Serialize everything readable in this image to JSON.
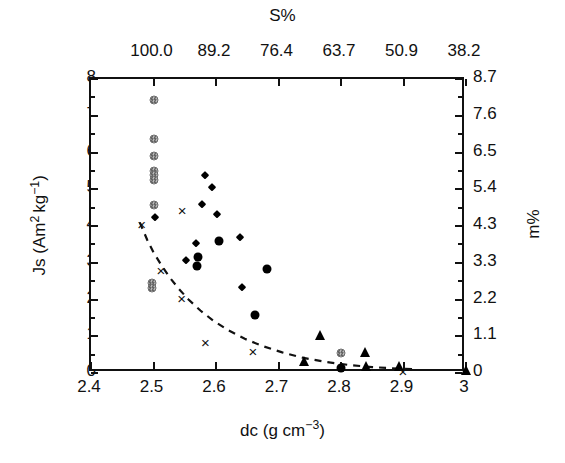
{
  "figure": {
    "panel_label": "b",
    "background": "#ffffff",
    "marker_color": "#000000",
    "stipple_color": "#6a6a6a"
  },
  "axes": {
    "bottom": {
      "title_main": "dc (g cm",
      "title_sup": "−3",
      "title_close": ")",
      "label": "dc (g cm−3)",
      "ticks": [
        "2.4",
        "2.5",
        "2.6",
        "2.7",
        "2.8",
        "2.9",
        "3"
      ],
      "range": [
        2.4,
        3.0
      ]
    },
    "top": {
      "title": "S%",
      "ticks": [
        "100.0",
        "89.2",
        "76.4",
        "63.7",
        "50.9",
        "38.2"
      ],
      "tick_positions_dc": [
        2.5,
        2.6,
        2.7,
        2.8,
        2.9,
        3.0
      ]
    },
    "left": {
      "title_main": "Js (Am",
      "title_sup1": "2",
      "title_mid": "kg",
      "title_sup2": "−1",
      "title_close": ")",
      "label": "Js (Am2 kg−1)",
      "ticks": [
        "0",
        "1",
        "2",
        "3",
        "4",
        "5",
        "6",
        "7",
        "8"
      ],
      "range": [
        0,
        8
      ]
    },
    "right": {
      "title": "m%",
      "ticks": [
        "0",
        "1.1",
        "2.2",
        "3.3",
        "4.3",
        "5.4",
        "6.5",
        "7.6",
        "8.7"
      ],
      "range": [
        0,
        8.7
      ]
    }
  },
  "chart_data": {
    "type": "scatter",
    "title": "",
    "xlabel": "dc (g cm−3)",
    "ylabel": "Js (Am2 kg−1)",
    "xlim": [
      2.4,
      3.0
    ],
    "ylim": [
      0,
      8
    ],
    "grid": false,
    "legend": "none",
    "secondary_xaxis": {
      "label": "S%",
      "ticks": [
        100.0,
        89.2,
        76.4,
        63.7,
        50.9,
        38.2
      ]
    },
    "secondary_yaxis": {
      "label": "m%",
      "ticks": [
        0,
        1.1,
        2.2,
        3.3,
        4.3,
        5.4,
        6.5,
        7.6,
        8.7
      ]
    },
    "series": [
      {
        "name": "stippled-circle",
        "marker": "circle-stipple",
        "size": 9,
        "points": [
          [
            2.5,
            7.42
          ],
          [
            2.5,
            6.38
          ],
          [
            2.5,
            5.9
          ],
          [
            2.5,
            5.5
          ],
          [
            2.5,
            5.38
          ],
          [
            2.5,
            5.26
          ],
          [
            2.5,
            4.58
          ],
          [
            2.497,
            2.46
          ],
          [
            2.497,
            2.31
          ],
          [
            2.8,
            0.55
          ]
        ]
      },
      {
        "name": "filled-circle",
        "marker": "circle-filled",
        "size": 9,
        "points": [
          [
            2.571,
            3.17
          ],
          [
            2.569,
            2.9
          ],
          [
            2.605,
            3.59
          ],
          [
            2.681,
            2.84
          ],
          [
            2.663,
            1.57
          ],
          [
            2.8,
            0.14
          ]
        ]
      },
      {
        "name": "filled-diamond",
        "marker": "diamond",
        "size": 8,
        "points": [
          [
            2.502,
            4.24
          ],
          [
            2.583,
            5.38
          ],
          [
            2.594,
            5.05
          ],
          [
            2.578,
            4.6
          ],
          [
            2.601,
            4.32
          ],
          [
            2.568,
            3.53
          ],
          [
            2.639,
            3.69
          ],
          [
            2.552,
            3.07
          ],
          [
            2.641,
            2.34
          ]
        ]
      },
      {
        "name": "filled-triangle",
        "marker": "triangle",
        "size": 10,
        "points": [
          [
            2.766,
            0.94
          ],
          [
            2.838,
            0.5
          ],
          [
            2.741,
            0.25
          ],
          [
            2.84,
            0.12
          ],
          [
            2.893,
            0.1
          ],
          [
            3.0,
            0.0
          ]
        ]
      },
      {
        "name": "cross",
        "marker": "x",
        "size": 10,
        "points": [
          [
            2.481,
            4.06
          ],
          [
            2.546,
            4.43
          ],
          [
            2.512,
            2.8
          ],
          [
            2.545,
            2.05
          ],
          [
            2.583,
            0.83
          ],
          [
            2.659,
            0.61
          ],
          [
            2.899,
            0.05
          ]
        ]
      }
    ],
    "fit_curve": {
      "name": "dashed-trend-line",
      "style": "dashed",
      "points": [
        [
          2.478,
          4.1
        ],
        [
          2.49,
          3.62
        ],
        [
          2.5,
          3.28
        ],
        [
          2.512,
          2.95
        ],
        [
          2.525,
          2.62
        ],
        [
          2.54,
          2.3
        ],
        [
          2.556,
          2.0
        ],
        [
          2.575,
          1.7
        ],
        [
          2.596,
          1.42
        ],
        [
          2.62,
          1.16
        ],
        [
          2.646,
          0.93
        ],
        [
          2.675,
          0.73
        ],
        [
          2.706,
          0.56
        ],
        [
          2.74,
          0.41
        ],
        [
          2.776,
          0.3
        ],
        [
          2.812,
          0.22
        ],
        [
          2.85,
          0.16
        ],
        [
          2.89,
          0.12
        ],
        [
          2.92,
          0.1
        ]
      ]
    }
  }
}
